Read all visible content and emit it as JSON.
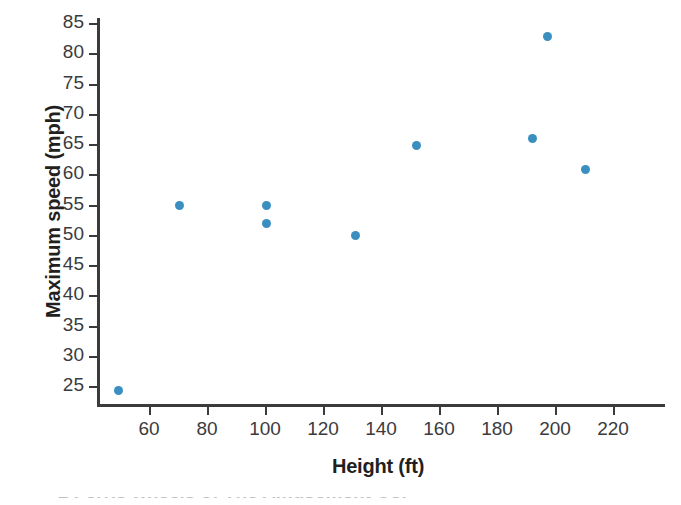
{
  "figure": {
    "background": "#ffffff",
    "axis_color": "#3b3b3d",
    "marker_color": "#3a8fc0",
    "caption_partial": "2   Ferris wheels of The Amusement Co."
  },
  "chart_data": {
    "type": "scatter",
    "title": "",
    "xlabel": "Height (ft)",
    "ylabel": "Maximum speed (mph)",
    "xlim": [
      45,
      240
    ],
    "ylim": [
      22,
      87
    ],
    "grid": false,
    "legend": null,
    "xticks": [
      60,
      80,
      100,
      120,
      140,
      160,
      180,
      200,
      220
    ],
    "yticks": [
      25,
      30,
      35,
      40,
      45,
      50,
      55,
      60,
      65,
      70,
      75,
      80,
      85
    ],
    "xtick_labels": [
      "60",
      "80",
      "100",
      "120",
      "140",
      "160",
      "180",
      "200",
      "220"
    ],
    "ytick_labels": [
      "25",
      "30",
      "35",
      "40",
      "45",
      "50",
      "55",
      "60",
      "65",
      "70",
      "75",
      "80",
      "85"
    ],
    "series": [
      {
        "name": "Ferris wheels",
        "marker": "circle",
        "color": "#3a8fc0",
        "points": [
          {
            "x": 49,
            "y": 24.5
          },
          {
            "x": 70,
            "y": 55
          },
          {
            "x": 100,
            "y": 55
          },
          {
            "x": 100,
            "y": 52
          },
          {
            "x": 131,
            "y": 50
          },
          {
            "x": 152,
            "y": 65
          },
          {
            "x": 192,
            "y": 66
          },
          {
            "x": 197,
            "y": 83
          },
          {
            "x": 210,
            "y": 61
          }
        ]
      }
    ]
  }
}
